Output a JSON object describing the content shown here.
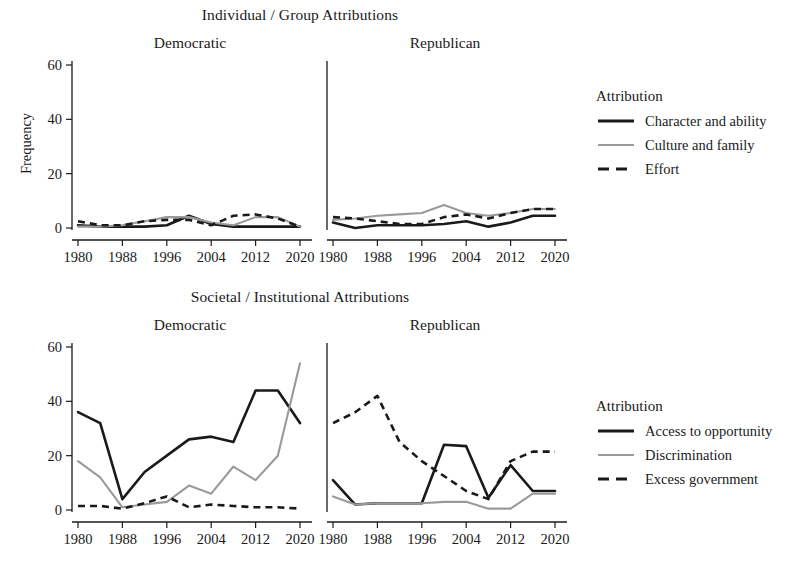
{
  "figure": {
    "y_axis_label": "Frequency",
    "facets": [
      "Democratic",
      "Republican"
    ],
    "x_ticks": [
      "1980",
      "1988",
      "1996",
      "2004",
      "2012",
      "2020"
    ],
    "y_ticks": [
      "0",
      "20",
      "40",
      "60"
    ],
    "legend_title": "Attribution",
    "colors": {
      "dark": "#1a1a1a",
      "light": "#9a9a9a",
      "background": "#ffffff"
    }
  },
  "panels": {
    "top": {
      "title": "Individual / Group Attributions",
      "legend_title": "Attribution",
      "legend": [
        {
          "label": "Character and ability",
          "style": "solid-dark"
        },
        {
          "label": "Culture and family",
          "style": "solid-light"
        },
        {
          "label": "Effort",
          "style": "dashed"
        }
      ]
    },
    "bottom": {
      "title": "Societal / Institutional Attributions",
      "legend_title": "Attribution",
      "legend": [
        {
          "label": "Access to opportunity",
          "style": "solid-dark"
        },
        {
          "label": "Discrimination",
          "style": "solid-light"
        },
        {
          "label": "Excess government",
          "style": "dashed"
        }
      ]
    }
  },
  "chart_data": [
    {
      "type": "line",
      "title": "Individual / Group Attributions",
      "facet": "Democratic",
      "xlabel": "",
      "ylabel": "Frequency",
      "ylim": [
        0,
        62
      ],
      "xlim": [
        1980,
        2020
      ],
      "x": [
        1980,
        1984,
        1988,
        1992,
        1996,
        2000,
        2004,
        2008,
        2012,
        2016,
        2020
      ],
      "grid": false,
      "legend_position": "right",
      "series": [
        {
          "name": "Character and ability",
          "style": "solid-dark",
          "values": [
            1,
            0.5,
            0.5,
            0.5,
            1,
            4.5,
            1.5,
            0.5,
            0.5,
            0.5,
            0.5
          ]
        },
        {
          "name": "Culture and family",
          "style": "solid-light",
          "values": [
            0.5,
            0.5,
            1,
            2.5,
            4,
            4,
            2,
            1,
            4,
            4,
            0.5
          ]
        },
        {
          "name": "Effort",
          "style": "dashed",
          "values": [
            2.5,
            1,
            1,
            2.5,
            3,
            3,
            1,
            4.5,
            5,
            3.5,
            0.5
          ]
        }
      ]
    },
    {
      "type": "line",
      "title": "Individual / Group Attributions",
      "facet": "Republican",
      "xlabel": "",
      "ylabel": "Frequency",
      "ylim": [
        0,
        62
      ],
      "xlim": [
        1980,
        2020
      ],
      "x": [
        1980,
        1984,
        1988,
        1992,
        1996,
        2000,
        2004,
        2008,
        2012,
        2016,
        2020
      ],
      "grid": false,
      "legend_position": "right",
      "series": [
        {
          "name": "Character and ability",
          "style": "solid-dark",
          "values": [
            2,
            0,
            1,
            1,
            1,
            1.5,
            2.5,
            0.5,
            2,
            4.5,
            4.5
          ]
        },
        {
          "name": "Culture and family",
          "style": "solid-light",
          "values": [
            3,
            3.5,
            4.5,
            5,
            5.5,
            8.5,
            5.5,
            4.5,
            5.5,
            7,
            7
          ]
        },
        {
          "name": "Effort",
          "style": "dashed",
          "values": [
            4,
            3.5,
            2.5,
            1.5,
            1.5,
            4,
            5,
            3.5,
            5.5,
            7,
            7
          ]
        }
      ]
    },
    {
      "type": "line",
      "title": "Societal / Institutional Attributions",
      "facet": "Democratic",
      "xlabel": "",
      "ylabel": "Frequency",
      "ylim": [
        0,
        62
      ],
      "xlim": [
        1980,
        2020
      ],
      "x": [
        1980,
        1984,
        1988,
        1992,
        1996,
        2000,
        2004,
        2008,
        2012,
        2016,
        2020
      ],
      "grid": false,
      "legend_position": "right",
      "series": [
        {
          "name": "Access to opportunity",
          "style": "solid-dark",
          "values": [
            36,
            32,
            4,
            14,
            20,
            26,
            27,
            25,
            44,
            44,
            32
          ]
        },
        {
          "name": "Discrimination",
          "style": "solid-light",
          "values": [
            18,
            12,
            1,
            2,
            3,
            9,
            6,
            16,
            11,
            20,
            54
          ]
        },
        {
          "name": "Excess government",
          "style": "dashed",
          "values": [
            1.5,
            1.5,
            0.5,
            2.5,
            5,
            1,
            2,
            1.5,
            1,
            1,
            0.5
          ]
        }
      ]
    },
    {
      "type": "line",
      "title": "Societal / Institutional Attributions",
      "facet": "Republican",
      "xlabel": "",
      "ylabel": "Frequency",
      "ylim": [
        0,
        62
      ],
      "xlim": [
        1980,
        2020
      ],
      "x": [
        1980,
        1984,
        1988,
        1992,
        1996,
        2000,
        2004,
        2008,
        2012,
        2016,
        2020
      ],
      "grid": false,
      "legend_position": "right",
      "series": [
        {
          "name": "Access to opportunity",
          "style": "solid-dark",
          "values": [
            11,
            2,
            2.5,
            2.5,
            2.5,
            24,
            23.5,
            4.5,
            16.5,
            7,
            7
          ]
        },
        {
          "name": "Discrimination",
          "style": "solid-light",
          "values": [
            5,
            2,
            2.5,
            2.5,
            2.5,
            3,
            3,
            0.5,
            0.5,
            6,
            6
          ]
        },
        {
          "name": "Excess government",
          "style": "dashed",
          "values": [
            32,
            36,
            42,
            25,
            18,
            12.5,
            7,
            4,
            18,
            21.5,
            21.5
          ]
        }
      ]
    }
  ]
}
